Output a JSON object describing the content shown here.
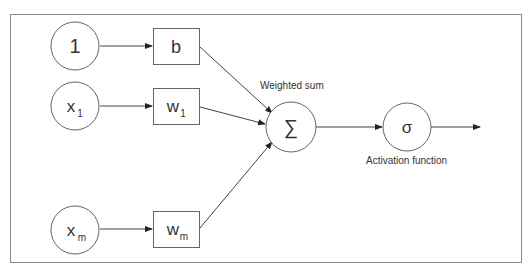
{
  "diagram": {
    "inputs": [
      {
        "id": "bias-input",
        "label": "1",
        "sub": ""
      },
      {
        "id": "x1-input",
        "label": "x",
        "sub": "1"
      },
      {
        "id": "xm-input",
        "label": "x",
        "sub": "m"
      }
    ],
    "weights": [
      {
        "id": "bias-weight",
        "label": "b",
        "sub": ""
      },
      {
        "id": "w1-weight",
        "label": "w",
        "sub": "1"
      },
      {
        "id": "wm-weight",
        "label": "w",
        "sub": "m"
      }
    ],
    "sum_node": {
      "symbol": "∑",
      "caption": "Weighted sum"
    },
    "activation_node": {
      "symbol": "σ",
      "caption": "Activation function"
    },
    "colors": {
      "stroke": "#555555",
      "text": "#333333",
      "frame": "#888888"
    }
  }
}
